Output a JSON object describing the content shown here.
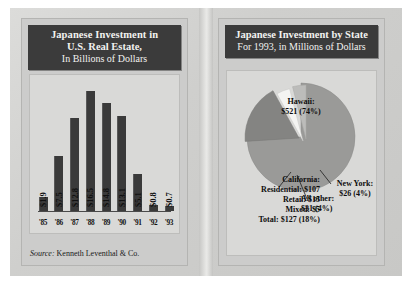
{
  "left_panel": {
    "title_line1": "Japanese Investment in",
    "title_line2": "U.S. Real Estate,",
    "title_line3": "In Billions of Dollars",
    "source_prefix": "Source:",
    "source_text": "Kenneth Leventhal & Co."
  },
  "right_panel": {
    "title_line1": "Japanese Investment by State",
    "title_line2": "For 1993, in Millions of Dollars"
  },
  "labels": {
    "hawaii_name": "Hawaii:",
    "hawaii_value": "$521 (74%)",
    "california_name": "California:",
    "california_residential": "Residential:  $107",
    "california_retail": "Retail:  $15",
    "california_mixed": "Mixed:  $5",
    "california_total": "Total:  $127 (18%)",
    "allother_name": "All other:",
    "allother_value": "$31 (4%)",
    "newyork_name": "New York:",
    "newyork_value": "$26 (4%)"
  },
  "colors": {
    "title_bg": "#3b3b3b",
    "title_fg": "#f2f2f0",
    "bar": "#3a3a3a",
    "plot_bg": "#d9d9d7",
    "panel_bg": "#cccccb",
    "hawaii_slice": "#9a9a98",
    "california_slice": "#848482",
    "allother_slice": "#f4f4f2",
    "newyork_slice": "#bcbcba"
  },
  "chart_data": [
    {
      "type": "bar",
      "title": "Japanese Investment in U.S. Real Estate, In Billions of Dollars",
      "xlabel": "",
      "ylabel": "Billions of Dollars",
      "categories": [
        "'85",
        "'86",
        "'87",
        "'88",
        "'89",
        "'90",
        "'91",
        "'92",
        "'93"
      ],
      "values": [
        1.9,
        7.5,
        12.8,
        16.5,
        14.8,
        13.1,
        5.1,
        0.8,
        0.7
      ],
      "data_labels": [
        "$1.9",
        "$7.5",
        "$12.8",
        "$16.5",
        "$14.8",
        "$13.1",
        "$5.1",
        "$0.8",
        "$0.7"
      ],
      "ylim": [
        0,
        16.5
      ],
      "grid": false,
      "legend": "none",
      "source": "Source: Kenneth Leventhal & Co."
    },
    {
      "type": "pie",
      "title": "Japanese Investment by State",
      "subtitle": "For 1993, in Millions of Dollars",
      "categories": [
        "Hawaii",
        "California",
        "All other",
        "New York"
      ],
      "values": [
        521,
        127,
        31,
        26
      ],
      "percents": [
        74,
        18,
        4,
        4
      ],
      "data_labels": [
        "$521 (74%)",
        "$127 (18%)",
        "$31 (4%)",
        "$26 (4%)"
      ],
      "breakdown": {
        "California": {
          "Residential": 107,
          "Retail": 15,
          "Mixed": 5,
          "Total": 127
        }
      },
      "units": "Millions of Dollars",
      "legend": "callout-labels"
    }
  ]
}
